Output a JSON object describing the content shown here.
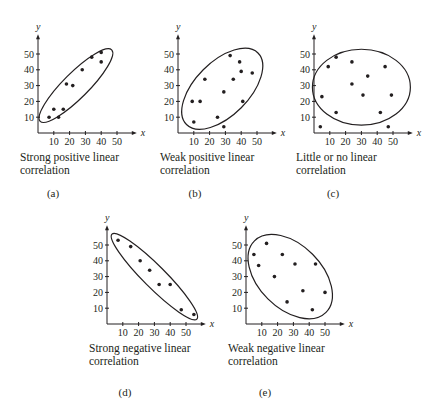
{
  "chart_data": [
    {
      "id": "a",
      "type": "scatter",
      "title": "",
      "caption": [
        "Strong positive linear",
        "correlation"
      ],
      "panel_label": "(a)",
      "xlabel": "x",
      "ylabel": "y",
      "xticks": [
        10,
        20,
        30,
        40,
        50
      ],
      "yticks": [
        10,
        20,
        30,
        40,
        50
      ],
      "xlim": [
        0,
        60
      ],
      "ylim": [
        0,
        60
      ],
      "grid": false,
      "points": [
        [
          7,
          10
        ],
        [
          10,
          15
        ],
        [
          13,
          10
        ],
        [
          16,
          15
        ],
        [
          18,
          31
        ],
        [
          22,
          30
        ],
        [
          28,
          40
        ],
        [
          34,
          48
        ],
        [
          40,
          45
        ],
        [
          40,
          51
        ]
      ],
      "ellipse": {
        "cx": 24,
        "cy": 30,
        "rx": 32,
        "ry": 8,
        "angle_deg": 45
      }
    },
    {
      "id": "b",
      "type": "scatter",
      "title": "",
      "caption": [
        "Weak positive linear",
        "correlation"
      ],
      "panel_label": "(b)",
      "xlabel": "x",
      "ylabel": "y",
      "xticks": [
        10,
        20,
        30,
        40,
        50
      ],
      "yticks": [
        10,
        20,
        30,
        40,
        50
      ],
      "xlim": [
        0,
        60
      ],
      "ylim": [
        0,
        60
      ],
      "grid": false,
      "points": [
        [
          9,
          20
        ],
        [
          10,
          7
        ],
        [
          14,
          20
        ],
        [
          17,
          34
        ],
        [
          25,
          10
        ],
        [
          29,
          4
        ],
        [
          29,
          26
        ],
        [
          33,
          49
        ],
        [
          35,
          34
        ],
        [
          39,
          45
        ],
        [
          40,
          39
        ],
        [
          41,
          20
        ],
        [
          47,
          38
        ]
      ],
      "ellipse": {
        "cx": 28,
        "cy": 28,
        "rx": 32,
        "ry": 17,
        "angle_deg": 45
      }
    },
    {
      "id": "c",
      "type": "scatter",
      "title": "",
      "caption": [
        "Little or no linear",
        "correlation"
      ],
      "panel_label": "(c)",
      "xlabel": "x",
      "ylabel": "y",
      "xticks": [
        10,
        20,
        30,
        40,
        50
      ],
      "yticks": [
        10,
        20,
        30,
        40,
        50
      ],
      "xlim": [
        0,
        60
      ],
      "ylim": [
        0,
        60
      ],
      "grid": false,
      "points": [
        [
          4,
          4
        ],
        [
          5,
          23
        ],
        [
          9,
          42
        ],
        [
          14,
          48
        ],
        [
          14,
          13
        ],
        [
          24,
          45
        ],
        [
          24,
          31
        ],
        [
          31,
          24
        ],
        [
          34,
          36
        ],
        [
          42,
          13
        ],
        [
          45,
          42
        ],
        [
          47,
          4
        ],
        [
          49,
          24
        ]
      ],
      "ellipse": {
        "cx": 30,
        "cy": 29,
        "rx": 31,
        "ry": 24,
        "angle_deg": 0
      }
    },
    {
      "id": "d",
      "type": "scatter",
      "title": "",
      "caption": [
        "Strong negative linear",
        "correlation"
      ],
      "panel_label": "(d)",
      "xlabel": "x",
      "ylabel": "y",
      "xticks": [
        10,
        20,
        30,
        40,
        50
      ],
      "yticks": [
        10,
        20,
        30,
        40,
        50
      ],
      "xlim": [
        0,
        60
      ],
      "ylim": [
        0,
        60
      ],
      "grid": false,
      "points": [
        [
          7,
          53
        ],
        [
          15,
          49
        ],
        [
          21,
          40
        ],
        [
          27,
          34
        ],
        [
          33,
          25
        ],
        [
          40,
          25
        ],
        [
          47,
          9
        ],
        [
          55,
          6
        ]
      ],
      "ellipse": {
        "cx": 30,
        "cy": 30,
        "rx": 38,
        "ry": 7,
        "angle_deg": -45
      }
    },
    {
      "id": "e",
      "type": "scatter",
      "title": "",
      "caption": [
        "Weak negative linear",
        "correlation"
      ],
      "panel_label": "(e)",
      "xlabel": "x",
      "ylabel": "y",
      "xticks": [
        10,
        20,
        30,
        40,
        50
      ],
      "yticks": [
        10,
        20,
        30,
        40,
        50
      ],
      "xlim": [
        0,
        60
      ],
      "ylim": [
        0,
        60
      ],
      "grid": false,
      "points": [
        [
          5,
          44
        ],
        [
          8,
          37
        ],
        [
          13,
          51
        ],
        [
          18,
          30
        ],
        [
          23,
          44
        ],
        [
          26,
          14
        ],
        [
          31,
          38
        ],
        [
          36,
          21
        ],
        [
          42,
          9
        ],
        [
          44,
          38
        ],
        [
          50,
          20
        ]
      ],
      "ellipse": {
        "cx": 28,
        "cy": 30,
        "rx": 32,
        "ry": 20,
        "angle_deg": -45
      }
    }
  ],
  "layout": {
    "panels": [
      {
        "ox": 38,
        "oy": 133,
        "caption_x": 20,
        "caption_y": 141,
        "letter_x": 38,
        "letter_y": 177
      },
      {
        "ox": 178,
        "oy": 133,
        "caption_x": 160,
        "caption_y": 141,
        "letter_x": 180,
        "letter_y": 177
      },
      {
        "ox": 314,
        "oy": 133,
        "caption_x": 296,
        "caption_y": 141,
        "letter_x": 318,
        "letter_y": 177
      },
      {
        "ox": 107,
        "oy": 324,
        "caption_x": 89,
        "caption_y": 332,
        "letter_x": 110,
        "letter_y": 376
      },
      {
        "ox": 246,
        "oy": 324,
        "caption_x": 228,
        "caption_y": 332,
        "letter_x": 250,
        "letter_y": 376
      }
    ],
    "scale_px_per_unit": 1.58,
    "ink_color": "#231f20"
  }
}
